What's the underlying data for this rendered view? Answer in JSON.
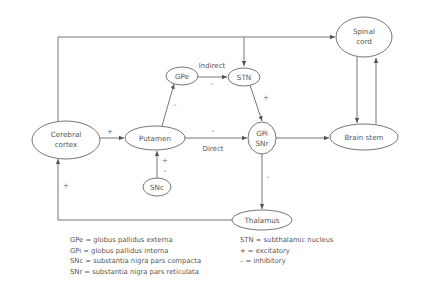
{
  "diagram": {
    "type": "basal-ganglia-motor-circuit",
    "nodes": {
      "spinal_cord": {
        "line1": "Spinal",
        "line2": "cord"
      },
      "cerebral_cortex": {
        "line1": "Cerebral",
        "line2": "cortex"
      },
      "putamen": {
        "label": "Putamen"
      },
      "gpe": {
        "label": "GPe"
      },
      "stn": {
        "label": "STN"
      },
      "gpi_snr": {
        "line1": "GPi",
        "line2": "SNr"
      },
      "brain_stem": {
        "label": "Brain stem"
      },
      "snc": {
        "label": "SNc"
      },
      "thalamus": {
        "label": "Thalamus"
      }
    },
    "pathway_labels": {
      "indirect": "Indirect",
      "direct": "Direct"
    },
    "edges": [
      {
        "from": "cerebral_cortex",
        "to": "putamen",
        "sign": "+"
      },
      {
        "from": "putamen",
        "to": "gpe",
        "sign": "–"
      },
      {
        "from": "gpe",
        "to": "stn",
        "sign": "–"
      },
      {
        "from": "stn",
        "to": "gpi_snr",
        "sign": "+"
      },
      {
        "from": "putamen",
        "to": "gpi_snr",
        "sign": "–"
      },
      {
        "from": "snc",
        "to": "putamen",
        "sign": "+/–"
      },
      {
        "from": "gpi_snr",
        "to": "thalamus",
        "sign": "–"
      },
      {
        "from": "thalamus",
        "to": "cerebral_cortex",
        "sign": "+"
      },
      {
        "from": "gpi_snr",
        "to": "brain_stem",
        "sign": ""
      },
      {
        "from": "cerebral_cortex",
        "to": "spinal_cord",
        "sign": ""
      },
      {
        "from": "cerebral_cortex",
        "to": "stn",
        "sign": ""
      },
      {
        "from": "spinal_cord",
        "to": "brain_stem",
        "sign": ""
      },
      {
        "from": "brain_stem",
        "to": "spinal_cord",
        "sign": ""
      }
    ],
    "signs": {
      "cortex_putamen": "+",
      "putamen_gpe": "–",
      "gpe_stn": "–",
      "stn_gpi": "+",
      "putamen_gpi": "–",
      "snc_plus": "+",
      "snc_minus": "–",
      "gpi_thalamus": "–",
      "thalamus_cortex": "+"
    }
  },
  "legend": {
    "left": [
      "GPe = globus pallidus externa",
      "GPi = globus pallidus interna",
      "SNc = substantia nigra pars compacta",
      "SNr = substantia nigra pars reticulata"
    ],
    "right": [
      "STN = subthalamic nucleus",
      "+ = excitatory",
      "– = inhibitory"
    ]
  }
}
